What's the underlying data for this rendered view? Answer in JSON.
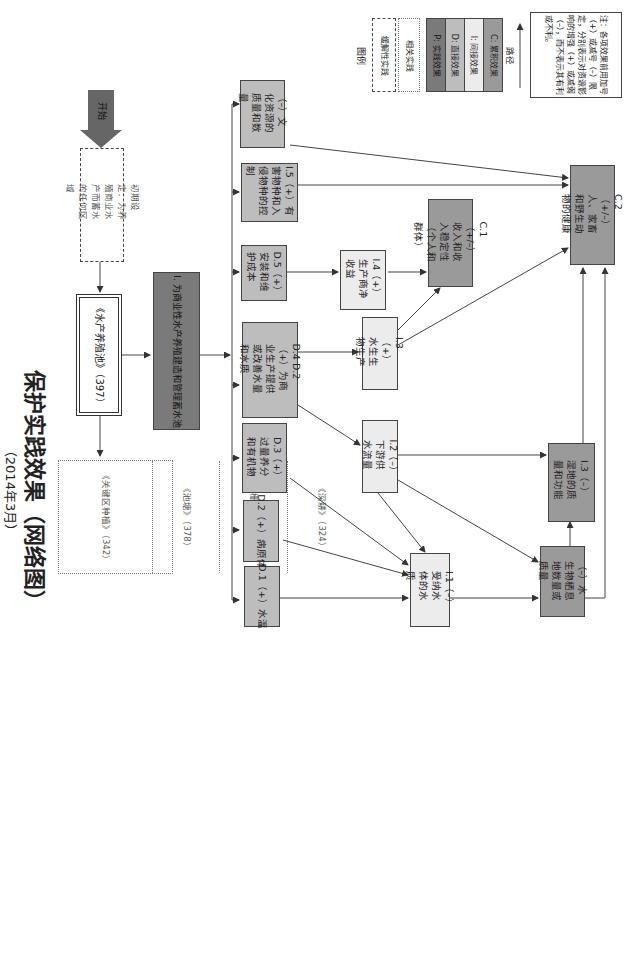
{
  "title": "保护实践效果（网络图）",
  "subtitle": "（2014年3月）",
  "start": {
    "label": "开始"
  },
  "initial_setting": {
    "label": "初期设定：为养殖商业水产而蓄水的任何区域"
  },
  "practice": {
    "label": "《水产养殖池》（397）"
  },
  "action": {
    "label": "I. 为商业性水产养殖建造和管理蓄水池"
  },
  "related_practices": [
    {
      "label": "《关键区种植》（342）"
    },
    {
      "label": "《池塘》（378）"
    },
    {
      "label": "《栅栏》（382）"
    },
    {
      "label": "《深耕》（324）"
    }
  ],
  "direct_effects": [
    {
      "id": "cultural",
      "label": "（–）文化资源的质量和数量"
    },
    {
      "id": "I5",
      "label": "I.5（+）有害物种和入侵物种的控制"
    },
    {
      "id": "D5",
      "label": "D.5（+）安装和维护成本"
    },
    {
      "id": "D4D2",
      "label": "D.4 D.2（+）为商业生产提供或改善水量和水质"
    },
    {
      "id": "D3",
      "label": "D.3（+）过量养分和有机物"
    },
    {
      "id": "D2",
      "label": "D.2（+）病原体"
    },
    {
      "id": "D1",
      "label": "D.1（+）水温"
    }
  ],
  "indirect_effects": [
    {
      "id": "I4",
      "label": "I.4（+）生产商净收益"
    },
    {
      "id": "I3",
      "label": "I.3（+）水生生物生产"
    },
    {
      "id": "I2",
      "label": "I.2（–）下游供水流量"
    },
    {
      "id": "I1",
      "label": "I.1（–）受纳水体的水质"
    },
    {
      "id": "I3w",
      "label": "I.3（–）湿地的质量和功能"
    },
    {
      "id": "habitat",
      "label": "（–）水生物栖息地数量或质量"
    }
  ],
  "cumulative_effects": [
    {
      "id": "C1",
      "label": "C.1（+/–）收入和收入稳定性（个人和群体）"
    },
    {
      "id": "C2",
      "label": "C.2（+/–）人、家畜和野生动物的健康"
    }
  ],
  "legend": {
    "title": "图例",
    "items": [
      {
        "label": "缓解性实践",
        "style": "dash-dot"
      },
      {
        "label": "相关实践",
        "style": "dotted"
      },
      {
        "label": "P: 实践效果",
        "color": "#7a7a7a"
      },
      {
        "label": "D: 直接效果",
        "color": "#bdbdbd"
      },
      {
        "label": "I: 间接效果",
        "color": "#ececec"
      },
      {
        "label": "C: 累积效果",
        "color": "#9a9a9a"
      }
    ],
    "path_label": "路径"
  },
  "note": "注：各项效果前用加号（+）或减号（–）限定，分别表示对资源影响的增强（+）或减弱（–），而不表示其有利或不利。"
}
